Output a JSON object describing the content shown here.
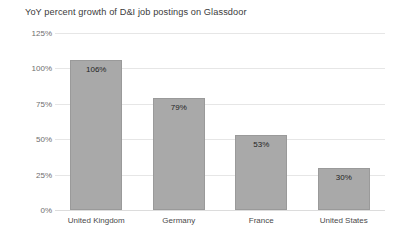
{
  "chart_data": {
    "type": "bar",
    "title": "YoY percent growth of D&I job postings on Glassdoor",
    "xlabel": "",
    "ylabel": "",
    "categories": [
      "United Kingdom",
      "Germany",
      "France",
      "United States"
    ],
    "values": [
      106,
      79,
      53,
      30
    ],
    "data_labels": [
      "106%",
      "79%",
      "53%",
      "30%"
    ],
    "ylim": [
      0,
      125
    ],
    "y_ticks": [
      0,
      25,
      50,
      75,
      100,
      125
    ],
    "y_tick_labels": [
      "0%",
      "25%",
      "50%",
      "75%",
      "100%",
      "125%"
    ],
    "grid": true,
    "grid_axis": "y",
    "legend": false,
    "legend_position": "none",
    "bar_color": "#a9a9a9",
    "bar_border_color": "#9a9a9a",
    "grid_color": "#e6e6e6",
    "background_color": "#ffffff",
    "title_color": "#3b3b3b",
    "tick_color": "#6e6e6e",
    "value_label_color": "#1f1f1f"
  }
}
